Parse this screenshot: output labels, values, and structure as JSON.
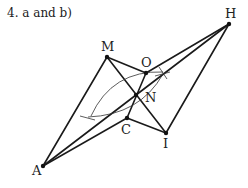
{
  "title": "4. a and b)",
  "points": {
    "M": {
      "label": "M",
      "x": 107,
      "y": 57
    },
    "H": {
      "label": "H",
      "x": 229,
      "y": 24
    },
    "O": {
      "label": "O",
      "x": 146,
      "y": 73
    },
    "N": {
      "label": "N",
      "x": 136,
      "y": 95
    },
    "C": {
      "label": "C",
      "x": 127,
      "y": 118
    },
    "I": {
      "label": "I",
      "x": 166,
      "y": 133
    },
    "A": {
      "label": "A",
      "x": 43,
      "y": 166
    }
  },
  "colors": {
    "line": "#1a1a1a",
    "construction": "#333333"
  }
}
